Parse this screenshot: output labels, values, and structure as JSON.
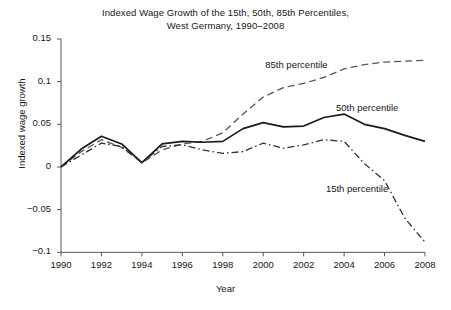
{
  "chart_data": {
    "type": "line",
    "title": "Indexed Wage Growth of the 15th, 50th, 85th Percentiles,",
    "subtitle": "West Germany, 1990–2008",
    "xlabel": "Year",
    "ylabel": "Indexed wage growth",
    "x": [
      1990,
      1991,
      1992,
      1993,
      1994,
      1995,
      1996,
      1997,
      1998,
      1999,
      2000,
      2001,
      2002,
      2003,
      2004,
      2005,
      2006,
      2007,
      2008
    ],
    "xlim": [
      1990,
      2008
    ],
    "ylim": [
      -0.1,
      0.15
    ],
    "xticks": [
      1990,
      1992,
      1994,
      1996,
      1998,
      2000,
      2002,
      2004,
      2006,
      2008
    ],
    "xtick_labels": [
      "1990",
      "1992",
      "1994",
      "1996",
      "1998",
      "2000",
      "2002",
      "2004",
      "2006",
      "2008"
    ],
    "yticks": [
      0.15,
      0.1,
      0.05,
      0,
      -0.05,
      -0.1
    ],
    "ytick_labels": [
      "0.15",
      "0.1",
      "0.05",
      "0",
      "−0.05",
      "−0.1"
    ],
    "grid": false,
    "legend_position": "inline-annotations",
    "series": [
      {
        "name": "85th percentile",
        "style": "dashed",
        "color": "#555555",
        "label_x": 2000.1,
        "label_y": 0.118,
        "values": [
          0,
          0.018,
          0.032,
          0.023,
          0.005,
          0.02,
          0.027,
          0.03,
          0.04,
          0.062,
          0.082,
          0.093,
          0.098,
          0.105,
          0.115,
          0.12,
          0.123,
          0.124,
          0.125
        ]
      },
      {
        "name": "50th percentile",
        "style": "solid",
        "color": "#1a1a1a",
        "label_x": 2003.6,
        "label_y": 0.068,
        "values": [
          0,
          0.021,
          0.036,
          0.027,
          0.005,
          0.027,
          0.03,
          0.029,
          0.03,
          0.045,
          0.052,
          0.047,
          0.048,
          0.058,
          0.062,
          0.05,
          0.045,
          0.037,
          0.03
        ]
      },
      {
        "name": "15th percentile",
        "style": "dashdot",
        "color": "#333333",
        "label_x": 2003.1,
        "label_y": -0.027,
        "values": [
          0,
          0.014,
          0.028,
          0.024,
          0.005,
          0.024,
          0.026,
          0.02,
          0.016,
          0.018,
          0.028,
          0.022,
          0.026,
          0.032,
          0.03,
          0.004,
          -0.016,
          -0.06,
          -0.088
        ]
      }
    ]
  }
}
